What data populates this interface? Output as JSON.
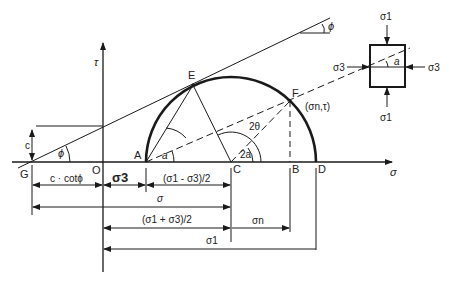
{
  "diagram": {
    "axes": {
      "x_label": "σ",
      "y_label": "τ"
    },
    "points": {
      "G": "G",
      "O": "O",
      "A": "A",
      "C": "C",
      "B": "B",
      "D": "D",
      "E": "E",
      "F": "F"
    },
    "point_F_coords": "(σn,τ)",
    "angles": {
      "phi_envelope": "ϕ",
      "phi_top": "ϕ",
      "alpha_A": "a",
      "two_alpha": "2a",
      "two_theta": "2θ",
      "alpha_element": "a"
    },
    "intercept": "c",
    "dimensions": {
      "c_cot_phi": "c · cotϕ",
      "sigma3": "σ3",
      "half_diff": "(σ1 - σ3)/2",
      "sigma": "σ",
      "half_sum": "(σ1 + σ3)/2",
      "sigma_n": "σn",
      "sigma1": "σ1"
    },
    "element": {
      "top_load": "σ1",
      "bottom_load": "σ1",
      "left_load": "σ3",
      "right_load": "σ3"
    },
    "colors": {
      "line": "#1a1a1a",
      "background": "#ffffff"
    }
  }
}
